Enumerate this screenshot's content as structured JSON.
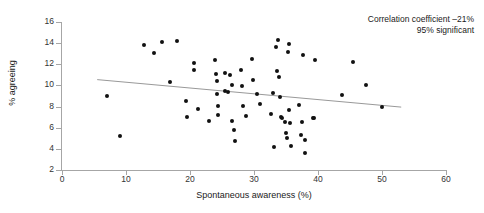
{
  "chart_data": {
    "type": "scatter",
    "title": "",
    "xlabel": "Spontaneous awareness (%)",
    "ylabel": "% agreeing",
    "xlim": [
      0,
      60
    ],
    "ylim": [
      2,
      16
    ],
    "xticks": [
      0,
      10,
      20,
      30,
      40,
      50,
      60
    ],
    "yticks": [
      2,
      4,
      6,
      8,
      10,
      12,
      14,
      16
    ],
    "grid": false,
    "legend": null,
    "annotations": [
      "Correlation coefficient –21%",
      "95% significant"
    ],
    "correlation_coefficient": "-21%",
    "significance": "95% significant",
    "trend_line": {
      "type": "linear-fit",
      "x_start": 5.5,
      "y_start": 10.55,
      "x_end": 53.0,
      "y_end": 7.95,
      "color": "#999999"
    },
    "points": [
      {
        "x": 7.0,
        "y": 9.0
      },
      {
        "x": 9.0,
        "y": 5.2
      },
      {
        "x": 12.8,
        "y": 13.85
      },
      {
        "x": 14.4,
        "y": 13.1
      },
      {
        "x": 15.6,
        "y": 14.1
      },
      {
        "x": 18.0,
        "y": 14.2
      },
      {
        "x": 16.8,
        "y": 10.3
      },
      {
        "x": 19.3,
        "y": 8.55
      },
      {
        "x": 19.5,
        "y": 7.05
      },
      {
        "x": 20.6,
        "y": 12.15
      },
      {
        "x": 20.7,
        "y": 11.45
      },
      {
        "x": 21.3,
        "y": 7.75
      },
      {
        "x": 22.9,
        "y": 6.65
      },
      {
        "x": 23.9,
        "y": 12.4
      },
      {
        "x": 24.1,
        "y": 11.1
      },
      {
        "x": 24.2,
        "y": 10.45
      },
      {
        "x": 24.2,
        "y": 9.2
      },
      {
        "x": 24.3,
        "y": 8.05
      },
      {
        "x": 24.4,
        "y": 7.2
      },
      {
        "x": 25.4,
        "y": 11.15
      },
      {
        "x": 25.4,
        "y": 9.5
      },
      {
        "x": 25.9,
        "y": 9.4
      },
      {
        "x": 26.3,
        "y": 11.0
      },
      {
        "x": 26.5,
        "y": 10.05
      },
      {
        "x": 26.6,
        "y": 6.65
      },
      {
        "x": 26.9,
        "y": 5.75
      },
      {
        "x": 27.0,
        "y": 4.7
      },
      {
        "x": 27.9,
        "y": 11.5
      },
      {
        "x": 28.2,
        "y": 9.9
      },
      {
        "x": 28.3,
        "y": 8.05
      },
      {
        "x": 28.8,
        "y": 7.1
      },
      {
        "x": 29.7,
        "y": 12.5
      },
      {
        "x": 29.9,
        "y": 10.55
      },
      {
        "x": 30.5,
        "y": 9.2
      },
      {
        "x": 30.9,
        "y": 8.2
      },
      {
        "x": 32.6,
        "y": 7.3
      },
      {
        "x": 33.0,
        "y": 9.25
      },
      {
        "x": 33.2,
        "y": 4.15
      },
      {
        "x": 33.4,
        "y": 13.6
      },
      {
        "x": 33.6,
        "y": 11.4
      },
      {
        "x": 33.8,
        "y": 14.3
      },
      {
        "x": 33.9,
        "y": 10.8
      },
      {
        "x": 34.0,
        "y": 8.95
      },
      {
        "x": 34.2,
        "y": 7.05
      },
      {
        "x": 34.4,
        "y": 6.9
      },
      {
        "x": 34.9,
        "y": 6.55
      },
      {
        "x": 35.0,
        "y": 5.5
      },
      {
        "x": 35.1,
        "y": 5.0
      },
      {
        "x": 35.3,
        "y": 13.15
      },
      {
        "x": 35.4,
        "y": 13.95
      },
      {
        "x": 35.5,
        "y": 7.65
      },
      {
        "x": 35.6,
        "y": 6.45
      },
      {
        "x": 35.8,
        "y": 4.3
      },
      {
        "x": 37.1,
        "y": 8.15
      },
      {
        "x": 37.3,
        "y": 5.3
      },
      {
        "x": 37.5,
        "y": 6.5
      },
      {
        "x": 37.6,
        "y": 12.85
      },
      {
        "x": 37.9,
        "y": 4.85
      },
      {
        "x": 38.0,
        "y": 3.6
      },
      {
        "x": 39.2,
        "y": 6.95
      },
      {
        "x": 39.4,
        "y": 6.9
      },
      {
        "x": 39.6,
        "y": 12.45
      },
      {
        "x": 43.8,
        "y": 9.1
      },
      {
        "x": 45.5,
        "y": 12.2
      },
      {
        "x": 47.5,
        "y": 10.05
      },
      {
        "x": 50.0,
        "y": 7.95
      }
    ]
  },
  "colors": {
    "point": "#111111",
    "axis": "#a6a6a6",
    "trend": "#999999",
    "text": "#1a1a1a",
    "background": "#ffffff"
  }
}
